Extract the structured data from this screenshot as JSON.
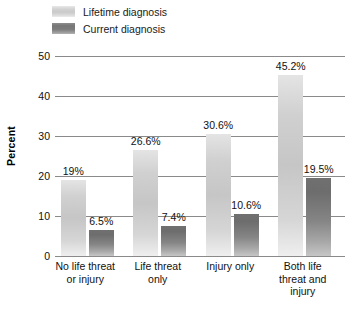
{
  "chart_data": {
    "type": "bar",
    "title": "",
    "subtitle": "",
    "xlabel": "",
    "ylabel": "Percent",
    "ylim": [
      0,
      50
    ],
    "yticks": [
      "0",
      "10",
      "20",
      "30",
      "40",
      "50"
    ],
    "grid": "horizontal",
    "legend_position": "top-left",
    "categories": [
      "No life threat\nor injury",
      "Life threat\nonly",
      "Injury only",
      "Both life\nthreat and\ninjury"
    ],
    "category_lines": [
      [
        "No life threat",
        "or injury"
      ],
      [
        "Life threat",
        "only"
      ],
      [
        "Injury only"
      ],
      [
        "Both life",
        "threat and",
        "injury"
      ]
    ],
    "series": [
      {
        "name": "Lifetime diagnosis",
        "color": "#d2d2d2",
        "values": [
          19.0,
          26.6,
          30.6,
          45.2
        ],
        "labels": [
          "19%",
          "26.6%",
          "30.6%",
          "45.2%"
        ]
      },
      {
        "name": "Current diagnosis",
        "color": "#7a7a7a",
        "values": [
          6.5,
          7.4,
          10.6,
          19.5
        ],
        "labels": [
          "6.5%",
          "7.4%",
          "10.6%",
          "19.5%"
        ]
      }
    ]
  },
  "legend": {
    "items": [
      {
        "label": "Lifetime diagnosis",
        "swatch": "swatch-lifetime"
      },
      {
        "label": "Current diagnosis",
        "swatch": "swatch-current"
      }
    ]
  },
  "axis": {
    "y_title": "Percent"
  }
}
